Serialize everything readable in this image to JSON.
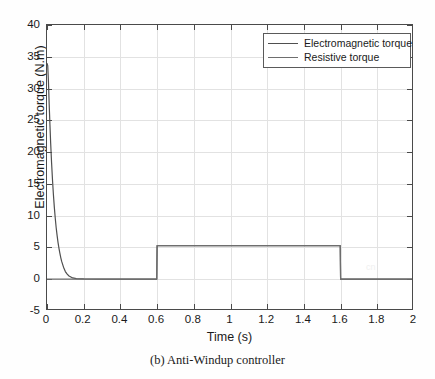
{
  "chart_data": {
    "type": "line",
    "title": "",
    "xlabel": "Time (s)",
    "ylabel": "Electromagnetic torque (N.m)",
    "xlim": [
      0,
      2
    ],
    "ylim": [
      -5,
      40
    ],
    "xticks": [
      "0",
      "0.2",
      "0.4",
      "0.6",
      "0.8",
      "1",
      "1.2",
      "1.4",
      "1.6",
      "1.8",
      "2"
    ],
    "xtick_values": [
      0,
      0.2,
      0.4,
      0.6,
      0.8,
      1,
      1.2,
      1.4,
      1.6,
      1.8,
      2
    ],
    "yticks": [
      "-5",
      "0",
      "5",
      "10",
      "15",
      "20",
      "25",
      "30",
      "35",
      "40"
    ],
    "ytick_values": [
      -5,
      0,
      5,
      10,
      15,
      20,
      25,
      30,
      35,
      40
    ],
    "grid": true,
    "legend_position": "top-right",
    "series": [
      {
        "name": "Electromagnetic torque",
        "color": "#4f4f4f",
        "points": [
          [
            0.0,
            34.0
          ],
          [
            0.004,
            33.6
          ],
          [
            0.008,
            31.0
          ],
          [
            0.012,
            27.5
          ],
          [
            0.016,
            24.3
          ],
          [
            0.02,
            21.4
          ],
          [
            0.025,
            18.3
          ],
          [
            0.03,
            15.6
          ],
          [
            0.035,
            13.3
          ],
          [
            0.04,
            11.3
          ],
          [
            0.045,
            9.6
          ],
          [
            0.05,
            8.1
          ],
          [
            0.055,
            6.9
          ],
          [
            0.06,
            5.8
          ],
          [
            0.065,
            4.9
          ],
          [
            0.07,
            4.1
          ],
          [
            0.075,
            3.4
          ],
          [
            0.08,
            2.8
          ],
          [
            0.09,
            1.9
          ],
          [
            0.1,
            1.2
          ],
          [
            0.11,
            0.8
          ],
          [
            0.12,
            0.5
          ],
          [
            0.14,
            0.2
          ],
          [
            0.16,
            0.1
          ],
          [
            0.2,
            0.05
          ],
          [
            0.3,
            0.02
          ],
          [
            0.4,
            0.0
          ],
          [
            0.5,
            0.0
          ],
          [
            0.598,
            0.0
          ],
          [
            0.6,
            5.3
          ],
          [
            0.8,
            5.3
          ],
          [
            1.0,
            5.3
          ],
          [
            1.2,
            5.3
          ],
          [
            1.4,
            5.3
          ],
          [
            1.598,
            5.3
          ],
          [
            1.6,
            0.0
          ],
          [
            1.8,
            0.0
          ],
          [
            2.0,
            0.0
          ]
        ]
      },
      {
        "name": "Resistive torque",
        "color": "#6e6e6e",
        "points": [
          [
            0.0,
            0.0
          ],
          [
            0.2,
            0.0
          ],
          [
            0.4,
            0.0
          ],
          [
            0.598,
            0.0
          ],
          [
            0.6,
            5.3
          ],
          [
            0.8,
            5.3
          ],
          [
            1.0,
            5.3
          ],
          [
            1.2,
            5.3
          ],
          [
            1.4,
            5.3
          ],
          [
            1.598,
            5.3
          ],
          [
            1.6,
            0.0
          ],
          [
            1.8,
            0.0
          ],
          [
            2.0,
            0.0
          ]
        ]
      }
    ],
    "annotations": {
      "step_start_time": 0.6,
      "step_end_time": 1.6,
      "step_level": 5.3,
      "peak_value": 34.0,
      "steady_value": 0.0
    }
  },
  "legend": {
    "entries": [
      {
        "label": "Electromagnetic torque"
      },
      {
        "label": "Resistive torque"
      }
    ]
  },
  "caption": {
    "text": "(b) Anti-Windup controller"
  },
  "colors": {
    "axis": "#4a4a4a",
    "grid": "#e2e2e2",
    "text": "#1a1a1a",
    "background": "#ffffff"
  }
}
